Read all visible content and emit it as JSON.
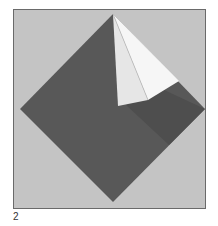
{
  "figure": {
    "caption_number": "2",
    "colors": {
      "background": "#c4c4c4",
      "paper_dark": "#5a5a5a",
      "paper_white": "#f2f2f2",
      "frame_border": "#6a6a6a"
    }
  }
}
